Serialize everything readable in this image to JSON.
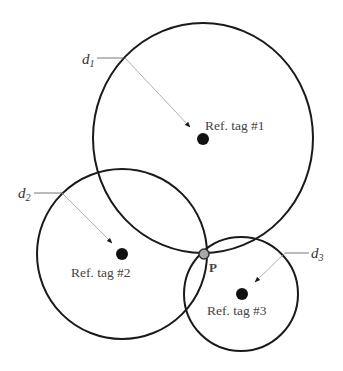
{
  "diagram": {
    "colors": {
      "circle_stroke": "#1a1a1a",
      "tag_dot": "#111111",
      "intersection_dot": "#a8a8a8",
      "text": "#444444"
    },
    "reference_tags": [
      {
        "label": "Ref. tag #1",
        "center": [
          203,
          138
        ],
        "radius_x": 110,
        "radius_y": 115,
        "distance_label": "d",
        "distance_sub": "1"
      },
      {
        "label": "Ref. tag #2",
        "center": [
          122,
          254
        ],
        "radius_x": 85,
        "radius_y": 85,
        "distance_label": "d",
        "distance_sub": "2"
      },
      {
        "label": "Ref. tag #3",
        "center": [
          242,
          294
        ],
        "radius_x": 57,
        "radius_y": 57,
        "distance_label": "d",
        "distance_sub": "3"
      }
    ],
    "intersection_point": {
      "label": "P",
      "position": [
        204,
        254
      ]
    }
  }
}
